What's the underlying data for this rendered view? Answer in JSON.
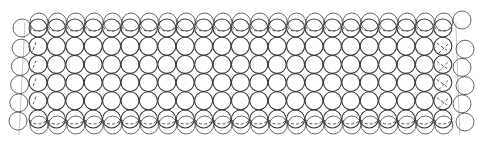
{
  "drawing": {
    "description": "Sketch of a grid of circles (rings) arranged in rows, top and bottom rows doubled/overlapping",
    "background": "#ffffff",
    "stroke_color": "#3a3a3a",
    "grid": {
      "columns": 23,
      "rows": 6,
      "origin_x": 38,
      "origin_y": 28,
      "pitch_x": 18.4,
      "pitch_y": 18.2,
      "radius": 9
    },
    "left_edge_column": {
      "x": 22,
      "rows": 6,
      "offset_y": 9
    },
    "right_edge_column": {
      "x": 462,
      "rows": 6,
      "offset_y": 9
    },
    "doubled_rows": {
      "top_offset_y": -6,
      "bottom_offset_y": 6
    }
  }
}
